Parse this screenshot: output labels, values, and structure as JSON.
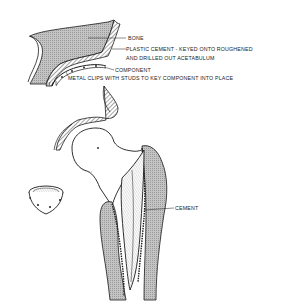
{
  "figure": {
    "labels": {
      "bone": "BONE",
      "cement_line1": "PLASTIC CEMENT - KEYED ONTO ROUGHENED",
      "cement_line2": "AND DRILLED OUT ACETABULUM",
      "component": "COMPONENT",
      "clips": "METAL CLIPS WITH STUDS TO KEY COMPONENT INTO PLACE",
      "femoral_cement": "CEMENT"
    },
    "colors": {
      "line": "#1a1a1a",
      "bone_fill": "#b9b9b9",
      "background": "#ffffff"
    }
  }
}
